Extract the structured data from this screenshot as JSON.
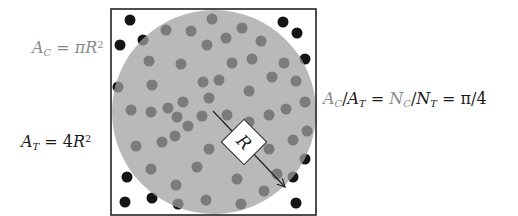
{
  "equations": {
    "circle_area": {
      "lhs": "A",
      "lhs_sub": "C",
      "eq": " = ",
      "rhs_pre": "π",
      "rhs_var": "R",
      "rhs_sup": "2"
    },
    "square_area": {
      "lhs": "A",
      "lhs_sub": "T",
      "eq": " = ",
      "rhs_pre": "4",
      "rhs_var": "R",
      "rhs_sup": "2"
    },
    "ratio": {
      "a": "A",
      "a_sub": "C",
      "slash1": "/",
      "b": "A",
      "b_sub": "T",
      "eq1": " = ",
      "c": "N",
      "c_sub": "C",
      "slash2": "/",
      "d": "N",
      "d_sub": "T",
      "eq2": " = ",
      "result": "π/4"
    }
  },
  "diagram": {
    "radius_label": "R",
    "colors": {
      "circle_fill": "#b9b9b9",
      "inside_dot": "#7b7b7b",
      "outside_dot": "#141414",
      "square_stroke": "#222222",
      "label_box": "#ffffff"
    },
    "square": {
      "x": 111,
      "y": 9,
      "size": 205
    },
    "circle": {
      "cx": 214,
      "cy": 112,
      "r": 102
    },
    "arrow": {
      "x1": 213,
      "y1": 111,
      "x2": 285,
      "y2": 187
    },
    "dots": [
      [
        166,
        30
      ],
      [
        191,
        31
      ],
      [
        212,
        19
      ],
      [
        242,
        28
      ],
      [
        226,
        38
      ],
      [
        207,
        45
      ],
      [
        261,
        41
      ],
      [
        143,
        40
      ],
      [
        149,
        61
      ],
      [
        181,
        64
      ],
      [
        232,
        63
      ],
      [
        252,
        59
      ],
      [
        284,
        63
      ],
      [
        203,
        82
      ],
      [
        219,
        80
      ],
      [
        152,
        85
      ],
      [
        272,
        77
      ],
      [
        296,
        81
      ],
      [
        118,
        87
      ],
      [
        249,
        91
      ],
      [
        209,
        98
      ],
      [
        183,
        102
      ],
      [
        305,
        102
      ],
      [
        131,
        110
      ],
      [
        151,
        112
      ],
      [
        168,
        108
      ],
      [
        177,
        117
      ],
      [
        202,
        116
      ],
      [
        227,
        115
      ],
      [
        269,
        115
      ],
      [
        286,
        109
      ],
      [
        188,
        126
      ],
      [
        249,
        122
      ],
      [
        307,
        131
      ],
      [
        175,
        136
      ],
      [
        162,
        142
      ],
      [
        136,
        146
      ],
      [
        209,
        149
      ],
      [
        269,
        149
      ],
      [
        293,
        140
      ],
      [
        305,
        159
      ],
      [
        151,
        169
      ],
      [
        197,
        167
      ],
      [
        277,
        174
      ],
      [
        293,
        177
      ],
      [
        237,
        179
      ],
      [
        176,
        185
      ],
      [
        264,
        191
      ],
      [
        206,
        200
      ],
      [
        178,
        204
      ],
      [
        241,
        204
      ],
      [
        130,
        20
      ],
      [
        120,
        45
      ],
      [
        283,
        22
      ],
      [
        297,
        33
      ],
      [
        305,
        59
      ],
      [
        127,
        177
      ],
      [
        125,
        202
      ],
      [
        152,
        198
      ],
      [
        296,
        203
      ]
    ],
    "dot_radius": 5.5
  }
}
